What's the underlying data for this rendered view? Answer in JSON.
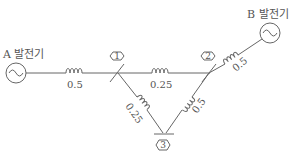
{
  "diagram": {
    "type": "power-system-single-line",
    "generators": [
      {
        "id": "A",
        "label": "A 발전기"
      },
      {
        "id": "B",
        "label": "B 발전기"
      }
    ],
    "buses": [
      {
        "id": "1",
        "label": "1"
      },
      {
        "id": "2",
        "label": "2"
      },
      {
        "id": "3",
        "label": "3"
      }
    ],
    "impedances": {
      "gen_a_to_bus1": "0.5",
      "bus1_to_bus2": "0.25",
      "bus2_to_gen_b": "0.5",
      "bus1_to_bus3": "0.25",
      "bus2_to_bus3": "0.5"
    }
  }
}
